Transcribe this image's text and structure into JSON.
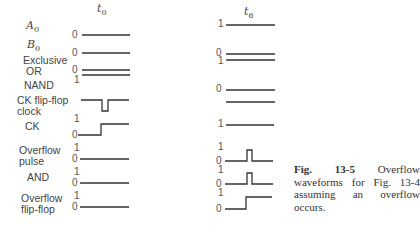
{
  "figure": {
    "columns": [
      {
        "id": "t0",
        "label": "t",
        "sub": "0"
      },
      {
        "id": "t6",
        "label": "t",
        "sub": "6"
      }
    ],
    "signals": [
      {
        "name": "A",
        "sub": "0",
        "t0_level": "0",
        "t6_level": "1"
      },
      {
        "name": "B",
        "sub": "0",
        "t0_level": "0",
        "t6_level": "0"
      },
      {
        "name": "Exclusive OR",
        "t0_level": "0",
        "t6_level": "1"
      },
      {
        "name": "NAND",
        "t0_level": "1",
        "t6_level": "0"
      },
      {
        "name": "CK flip-flop clock",
        "t0_level": "",
        "t6_level": ""
      },
      {
        "name": "CK",
        "t0_levels": [
          "1",
          "0"
        ],
        "t6_level": "1"
      },
      {
        "name": "Overflow pulse",
        "t0_levels": [
          "1",
          "0"
        ],
        "t6_levels": [
          "1",
          "0"
        ]
      },
      {
        "name": "AND",
        "t0_levels": [
          "1",
          "0"
        ],
        "t6_levels": [
          "1",
          "0"
        ]
      },
      {
        "name": "Overflow flip-flop",
        "t0_levels": [
          "1",
          "0"
        ],
        "t6_levels": [
          "1",
          "0"
        ]
      }
    ],
    "labels": {
      "a0": "A",
      "a0_sub": "0",
      "b0": "B",
      "b0_sub": "0",
      "xor_line1": "Exclusive",
      "xor_line2": "OR",
      "nand": "NAND",
      "ckff_line1": "CK flip-flop",
      "ckff_line2": "clock",
      "ck": "CK",
      "ofp_line1": "Overflow",
      "ofp_line2": "pulse",
      "and": "AND",
      "offf_line1": "Overflow",
      "offf_line2": "flip-flop"
    },
    "levels": {
      "zero": "0",
      "one": "1"
    },
    "caption": {
      "number": "Fig. 13-5",
      "text": "Overflow waveforms for Fig. 13-4 assuming an overflow occurs."
    }
  }
}
